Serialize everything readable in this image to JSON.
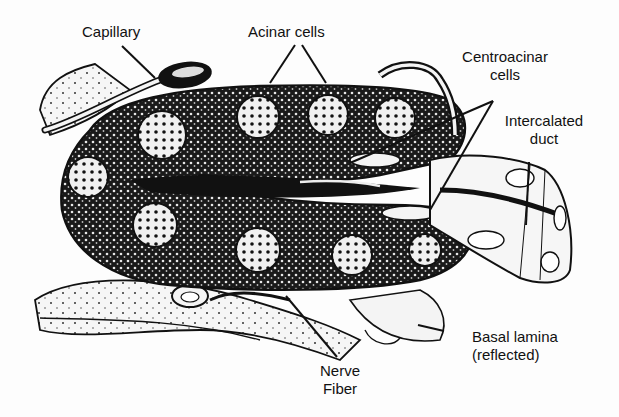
{
  "diagram": {
    "colors": {
      "ink": "#111111",
      "paper": "#fdfdfd",
      "cytoplasm": "#1a1a1a",
      "nucleus": "#f2f2f2"
    },
    "labels": {
      "capillary": "Capillary",
      "acinar_cells": "Acinar cells",
      "centroacinar_line1": "Centroacinar",
      "centroacinar_line2": "cells",
      "intercalated_line1": "Intercalated",
      "intercalated_line2": "duct",
      "basal_lamina_line1": "Basal lamina",
      "basal_lamina_line2": "(reflected)",
      "nerve_line1": "Nerve",
      "nerve_line2": "Fiber"
    }
  }
}
